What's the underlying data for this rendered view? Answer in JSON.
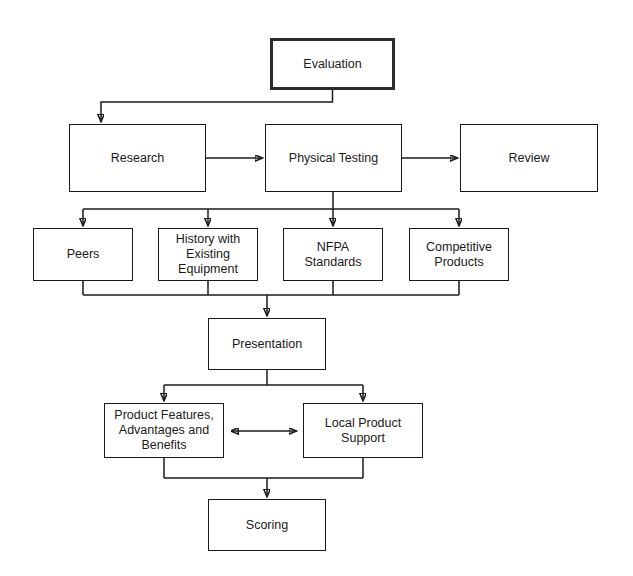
{
  "diagram": {
    "background_color": "#ffffff",
    "line_color": "#1a1a1a",
    "text_color": "#1a1a1a",
    "nodes": [
      {
        "id": "evaluation",
        "label": "Evaluation",
        "x": 270,
        "y": 38,
        "w": 125,
        "h": 52,
        "emphasis": true
      },
      {
        "id": "research",
        "label": "Research",
        "x": 69,
        "y": 124,
        "w": 137,
        "h": 68,
        "emphasis": false
      },
      {
        "id": "physical-testing",
        "label": "Physical Testing",
        "x": 265,
        "y": 124,
        "w": 137,
        "h": 68,
        "emphasis": false
      },
      {
        "id": "review",
        "label": "Review",
        "x": 460,
        "y": 124,
        "w": 138,
        "h": 68,
        "emphasis": false
      },
      {
        "id": "peers",
        "label": "Peers",
        "x": 33,
        "y": 228,
        "w": 100,
        "h": 53,
        "emphasis": false
      },
      {
        "id": "history-existing-equipment",
        "label": "History with\nExisting\nEquipment",
        "x": 158,
        "y": 228,
        "w": 100,
        "h": 53,
        "emphasis": false
      },
      {
        "id": "nfpa-standards",
        "label": "NFPA\nStandards",
        "x": 283,
        "y": 228,
        "w": 100,
        "h": 53,
        "emphasis": false
      },
      {
        "id": "competitive-products",
        "label": "Competitive\nProducts",
        "x": 409,
        "y": 228,
        "w": 100,
        "h": 53,
        "emphasis": false
      },
      {
        "id": "presentation",
        "label": "Presentation",
        "x": 208,
        "y": 318,
        "w": 118,
        "h": 52,
        "emphasis": false
      },
      {
        "id": "product-features",
        "label": "Product Features,\nAdvantages and\nBenefits",
        "x": 104,
        "y": 403,
        "w": 120,
        "h": 55,
        "emphasis": false
      },
      {
        "id": "local-product-support",
        "label": "Local Product\nSupport",
        "x": 303,
        "y": 403,
        "w": 120,
        "h": 55,
        "emphasis": false
      },
      {
        "id": "scoring",
        "label": "Scoring",
        "x": 208,
        "y": 499,
        "w": 118,
        "h": 52,
        "emphasis": false
      }
    ],
    "edges": [
      {
        "id": "evaluation-to-research",
        "from": "evaluation",
        "to": "research",
        "style": "elbow",
        "arrowheads": 1
      },
      {
        "id": "research-to-physical-testing",
        "from": "research",
        "to": "physical-testing",
        "style": "straight",
        "arrowheads": 1
      },
      {
        "id": "physical-testing-to-review",
        "from": "physical-testing",
        "to": "review",
        "style": "straight",
        "arrowheads": 1
      },
      {
        "id": "testing-to-peers",
        "from": "physical-testing",
        "to": "peers",
        "style": "bus",
        "arrowheads": 1
      },
      {
        "id": "testing-to-history",
        "from": "physical-testing",
        "to": "history-existing-equipment",
        "style": "bus",
        "arrowheads": 1
      },
      {
        "id": "testing-to-nfpa",
        "from": "physical-testing",
        "to": "nfpa-standards",
        "style": "bus",
        "arrowheads": 1
      },
      {
        "id": "testing-to-competitive",
        "from": "physical-testing",
        "to": "competitive-products",
        "style": "bus",
        "arrowheads": 1
      },
      {
        "id": "row3-to-presentation",
        "from": "row3",
        "to": "presentation",
        "style": "merge-bus",
        "arrowheads": 1
      },
      {
        "id": "presentation-to-features",
        "from": "presentation",
        "to": "product-features",
        "style": "bus",
        "arrowheads": 1
      },
      {
        "id": "presentation-to-support",
        "from": "presentation",
        "to": "local-product-support",
        "style": "bus",
        "arrowheads": 1
      },
      {
        "id": "features-support-bidirectional",
        "from": "product-features",
        "to": "local-product-support",
        "style": "straight",
        "arrowheads": 2
      },
      {
        "id": "row5-to-scoring",
        "from": "row5",
        "to": "scoring",
        "style": "merge-bus",
        "arrowheads": 1
      }
    ]
  }
}
